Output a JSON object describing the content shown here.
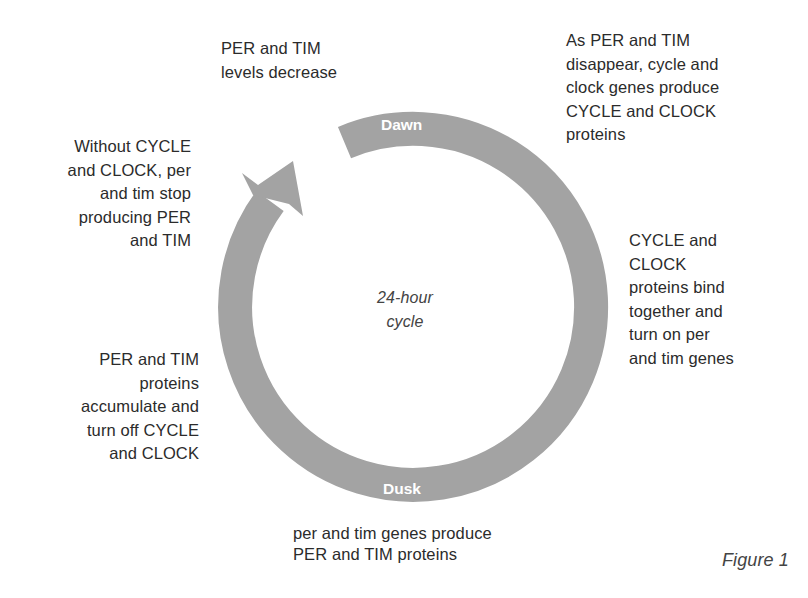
{
  "diagram": {
    "center_label": "24-hour\ncycle",
    "ring": {
      "top_label": "Dawn",
      "bottom_label": "Dusk",
      "color": "#a3a3a3"
    },
    "steps": [
      {
        "id": "top-left",
        "text": "PER and TIM\nlevels decrease"
      },
      {
        "id": "top-right",
        "text": "As PER and TIM\ndisappear, cycle and\nclock genes produce\nCYCLE and CLOCK\nproteins"
      },
      {
        "id": "right",
        "text": "CYCLE and\nCLOCK\nproteins bind\ntogether and\nturn on per\nand tim genes"
      },
      {
        "id": "bottom",
        "text": "per and tim genes produce\nPER and TIM proteins"
      },
      {
        "id": "bottom-left",
        "text": "PER and TIM\nproteins\naccumulate and\nturn off CYCLE\nand CLOCK"
      },
      {
        "id": "left",
        "text": "Without CYCLE\nand CLOCK, per\nand tim stop\nproducing PER\nand TIM"
      }
    ],
    "caption": "Figure 1"
  }
}
